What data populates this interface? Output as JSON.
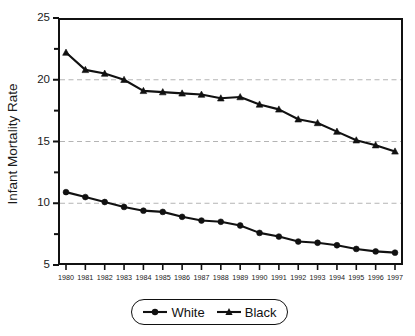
{
  "chart_data": {
    "type": "line",
    "title": "",
    "xlabel": "",
    "ylabel": "Infant Mortality Rate",
    "categories": [
      "1980",
      "1981",
      "1982",
      "1983",
      "1984",
      "1985",
      "1986",
      "1987",
      "1988",
      "1989",
      "1990",
      "1991",
      "1992",
      "1993",
      "1994",
      "1995",
      "1996",
      "1997"
    ],
    "x": [
      1980,
      1981,
      1982,
      1983,
      1984,
      1985,
      1986,
      1987,
      1988,
      1989,
      1990,
      1991,
      1992,
      1993,
      1994,
      1995,
      1996,
      1997
    ],
    "series": [
      {
        "name": "White",
        "marker": "circle",
        "color": "#111111",
        "values": [
          10.9,
          10.5,
          10.1,
          9.7,
          9.4,
          9.3,
          8.9,
          8.6,
          8.5,
          8.2,
          7.6,
          7.3,
          6.9,
          6.8,
          6.6,
          6.3,
          6.1,
          6.0
        ]
      },
      {
        "name": "Black",
        "marker": "triangle",
        "color": "#111111",
        "values": [
          22.2,
          20.8,
          20.5,
          20.0,
          19.1,
          19.0,
          18.9,
          18.8,
          18.5,
          18.6,
          18.0,
          17.6,
          16.8,
          16.5,
          15.8,
          15.1,
          14.7,
          14.2
        ]
      }
    ],
    "ylim": [
      5,
      25
    ],
    "yticks": [
      5,
      10,
      15,
      20,
      25
    ],
    "ytick_labels": [
      "5",
      "10",
      "15",
      "20",
      "25"
    ],
    "yminor_ticks": [
      7.5,
      12.5,
      17.5,
      22.5
    ],
    "grid": true,
    "gridlines_at": [
      10,
      15,
      20
    ],
    "grid_style": "dashed",
    "grid_color": "#b4b4b4",
    "legend_position": "bottom-center",
    "legend_entries": [
      "White",
      "Black"
    ],
    "axis_color": "#111111",
    "background": "#ffffff"
  },
  "axis": {
    "y_label": "Infant Mortality Rate"
  },
  "legend": {
    "items": [
      {
        "label": "White"
      },
      {
        "label": "Black"
      }
    ]
  }
}
